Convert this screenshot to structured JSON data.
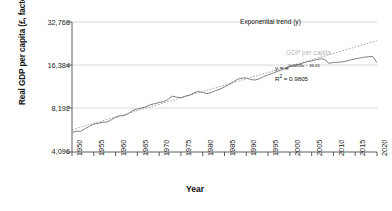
{
  "chart_data": {
    "type": "line",
    "title": "",
    "xlabel": "Year",
    "ylabel": "Real GDP per capita (£, factor cost)",
    "xlim": [
      1950,
      2020
    ],
    "ylim": [
      4096,
      32768
    ],
    "yscale": "log2",
    "grid": true,
    "legend_position": "inline-annotations",
    "yticks": [
      "4,096",
      "8,192",
      "16,384",
      "32,768"
    ],
    "ytick_values": [
      4096,
      8192,
      16384,
      32768
    ],
    "xticks": [
      "1950",
      "1955",
      "1960",
      "1965",
      "1970",
      "1975",
      "1980",
      "1985",
      "1990",
      "1995",
      "2000",
      "2005",
      "2010",
      "2015",
      "2020"
    ],
    "annotations": [
      {
        "name": "exponential-trend-label",
        "text": "Exponential trend (y)"
      },
      {
        "name": "gdp-per-capita-label",
        "text": "GDP per capita"
      },
      {
        "name": "equation-label",
        "text": "y = e",
        "exponent": "0.0203x − 36.61"
      },
      {
        "name": "r-squared-label",
        "text": "R",
        "sup": "2",
        "value": " = 0.9805"
      }
    ],
    "series": [
      {
        "name": "GDP per capita",
        "style": "solid",
        "color": "#7f7f7f",
        "x": [
          1950,
          1951,
          1952,
          1953,
          1954,
          1955,
          1956,
          1957,
          1958,
          1959,
          1960,
          1961,
          1962,
          1963,
          1964,
          1965,
          1966,
          1967,
          1968,
          1969,
          1970,
          1971,
          1972,
          1973,
          1974,
          1975,
          1976,
          1977,
          1978,
          1979,
          1980,
          1981,
          1982,
          1983,
          1984,
          1985,
          1986,
          1987,
          1988,
          1989,
          1990,
          1991,
          1992,
          1993,
          1994,
          1995,
          1996,
          1997,
          1998,
          1999,
          2000,
          2001,
          2002,
          2003,
          2004,
          2005,
          2006,
          2007,
          2008,
          2009,
          2010,
          2011,
          2012,
          2013,
          2014,
          2015,
          2016,
          2017,
          2018,
          2019,
          2020
        ],
        "values": [
          5600,
          5720,
          5700,
          5950,
          6180,
          6400,
          6470,
          6600,
          6600,
          6850,
          7150,
          7300,
          7330,
          7600,
          7980,
          8150,
          8280,
          8450,
          8750,
          8870,
          9050,
          9160,
          9480,
          10010,
          9860,
          9750,
          10010,
          10170,
          10540,
          10800,
          10600,
          10430,
          10600,
          10950,
          11200,
          11600,
          12050,
          12550,
          13100,
          13350,
          13400,
          13050,
          12950,
          13200,
          13700,
          14050,
          14400,
          14800,
          15200,
          15600,
          16050,
          16350,
          16600,
          17000,
          17350,
          17600,
          17900,
          18200,
          18000,
          16900,
          17150,
          17200,
          17300,
          17550,
          17900,
          18150,
          18400,
          18650,
          18800,
          18900,
          17100
        ]
      },
      {
        "name": "Exponential trend (y)",
        "style": "dotted",
        "color": "#9a9a9a",
        "x": [
          1950,
          2020
        ],
        "values": [
          5850,
          24300
        ]
      }
    ]
  }
}
